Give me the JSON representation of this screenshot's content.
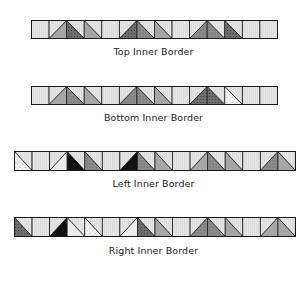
{
  "colors": {
    "background": "#ffffff",
    "outline": "#1a1a1a",
    "plain": "#e6e6e6",
    "light": "#ececec",
    "gray": "#a6a6a6",
    "dot_gray": "#8c8c8c",
    "dark_dot": "#6e6e6e",
    "black": "#111111",
    "speckle": "#f2f2f2"
  },
  "borders": [
    {
      "id": "top",
      "label": "Top Inner Border",
      "x": 31,
      "y": 20,
      "cell": 17.57,
      "height": 18,
      "label_y": 46,
      "squares": [
        {
          "type": "plain"
        },
        {
          "type": "hst",
          "diag": "/",
          "fill": "gray"
        },
        {
          "type": "hst",
          "diag": "\\",
          "fill": "dark_dot"
        },
        {
          "type": "hst",
          "diag": "\\",
          "fill": "gray"
        },
        {
          "type": "plain"
        },
        {
          "type": "hst",
          "diag": "/",
          "fill": "dark_dot"
        },
        {
          "type": "hst",
          "diag": "\\",
          "fill": "dot_gray"
        },
        {
          "type": "hst",
          "diag": "\\",
          "fill": "gray"
        },
        {
          "type": "plain"
        },
        {
          "type": "hst",
          "diag": "/",
          "fill": "dot_gray"
        },
        {
          "type": "hst",
          "diag": "\\",
          "fill": "dot_gray"
        },
        {
          "type": "hst",
          "diag": "\\",
          "fill": "dark_dot"
        },
        {
          "type": "plain"
        },
        {
          "type": "plain"
        }
      ]
    },
    {
      "id": "bottom",
      "label": "Bottom Inner Border",
      "x": 31,
      "y": 86,
      "cell": 17.57,
      "height": 18,
      "label_y": 112,
      "squares": [
        {
          "type": "plain"
        },
        {
          "type": "hst",
          "diag": "/",
          "fill": "gray"
        },
        {
          "type": "hst",
          "diag": "\\",
          "fill": "dot_gray"
        },
        {
          "type": "hst",
          "diag": "\\",
          "fill": "gray"
        },
        {
          "type": "plain"
        },
        {
          "type": "hst",
          "diag": "/",
          "fill": "dot_gray"
        },
        {
          "type": "hst",
          "diag": "\\",
          "fill": "dot_gray"
        },
        {
          "type": "hst",
          "diag": "\\",
          "fill": "gray"
        },
        {
          "type": "plain"
        },
        {
          "type": "hst",
          "diag": "/",
          "fill": "dark_dot"
        },
        {
          "type": "hst",
          "diag": "\\",
          "fill": "dark_dot"
        },
        {
          "type": "hst",
          "diag": "\\",
          "fill": "speckle"
        },
        {
          "type": "plain"
        },
        {
          "type": "plain"
        }
      ]
    },
    {
      "id": "left",
      "label": "Left Inner Border",
      "x": 14,
      "y": 151,
      "cell": 17.56,
      "height": 19,
      "label_y": 178,
      "squares": [
        {
          "type": "hst",
          "diag": "\\",
          "fill": "speckle"
        },
        {
          "type": "plain"
        },
        {
          "type": "hst",
          "diag": "/",
          "fill": "light"
        },
        {
          "type": "hst",
          "diag": "\\",
          "fill": "black"
        },
        {
          "type": "hst",
          "diag": "\\",
          "fill": "dot_gray"
        },
        {
          "type": "plain"
        },
        {
          "type": "hst",
          "diag": "/",
          "fill": "black"
        },
        {
          "type": "hst",
          "diag": "\\",
          "fill": "dot_gray"
        },
        {
          "type": "hst",
          "diag": "\\",
          "fill": "gray"
        },
        {
          "type": "plain"
        },
        {
          "type": "hst",
          "diag": "/",
          "fill": "gray"
        },
        {
          "type": "hst",
          "diag": "\\",
          "fill": "dot_gray"
        },
        {
          "type": "hst",
          "diag": "\\",
          "fill": "gray"
        },
        {
          "type": "plain"
        },
        {
          "type": "hst",
          "diag": "/",
          "fill": "dot_gray"
        },
        {
          "type": "hst",
          "diag": "\\",
          "fill": "gray"
        }
      ]
    },
    {
      "id": "right",
      "label": "Right Inner Border",
      "x": 14,
      "y": 217,
      "cell": 17.56,
      "height": 19,
      "label_y": 245,
      "squares": [
        {
          "type": "hst",
          "diag": "\\",
          "fill": "dark_dot"
        },
        {
          "type": "plain"
        },
        {
          "type": "hst",
          "diag": "/",
          "fill": "black"
        },
        {
          "type": "hst",
          "diag": "\\",
          "fill": "light"
        },
        {
          "type": "hst",
          "diag": "\\",
          "fill": "speckle"
        },
        {
          "type": "plain"
        },
        {
          "type": "hst",
          "diag": "/",
          "fill": "light"
        },
        {
          "type": "hst",
          "diag": "\\",
          "fill": "dark_dot"
        },
        {
          "type": "hst",
          "diag": "\\",
          "fill": "gray"
        },
        {
          "type": "plain"
        },
        {
          "type": "hst",
          "diag": "/",
          "fill": "dot_gray"
        },
        {
          "type": "hst",
          "diag": "\\",
          "fill": "dot_gray"
        },
        {
          "type": "hst",
          "diag": "\\",
          "fill": "gray"
        },
        {
          "type": "plain"
        },
        {
          "type": "hst",
          "diag": "/",
          "fill": "gray"
        },
        {
          "type": "hst",
          "diag": "\\",
          "fill": "gray"
        }
      ]
    }
  ]
}
